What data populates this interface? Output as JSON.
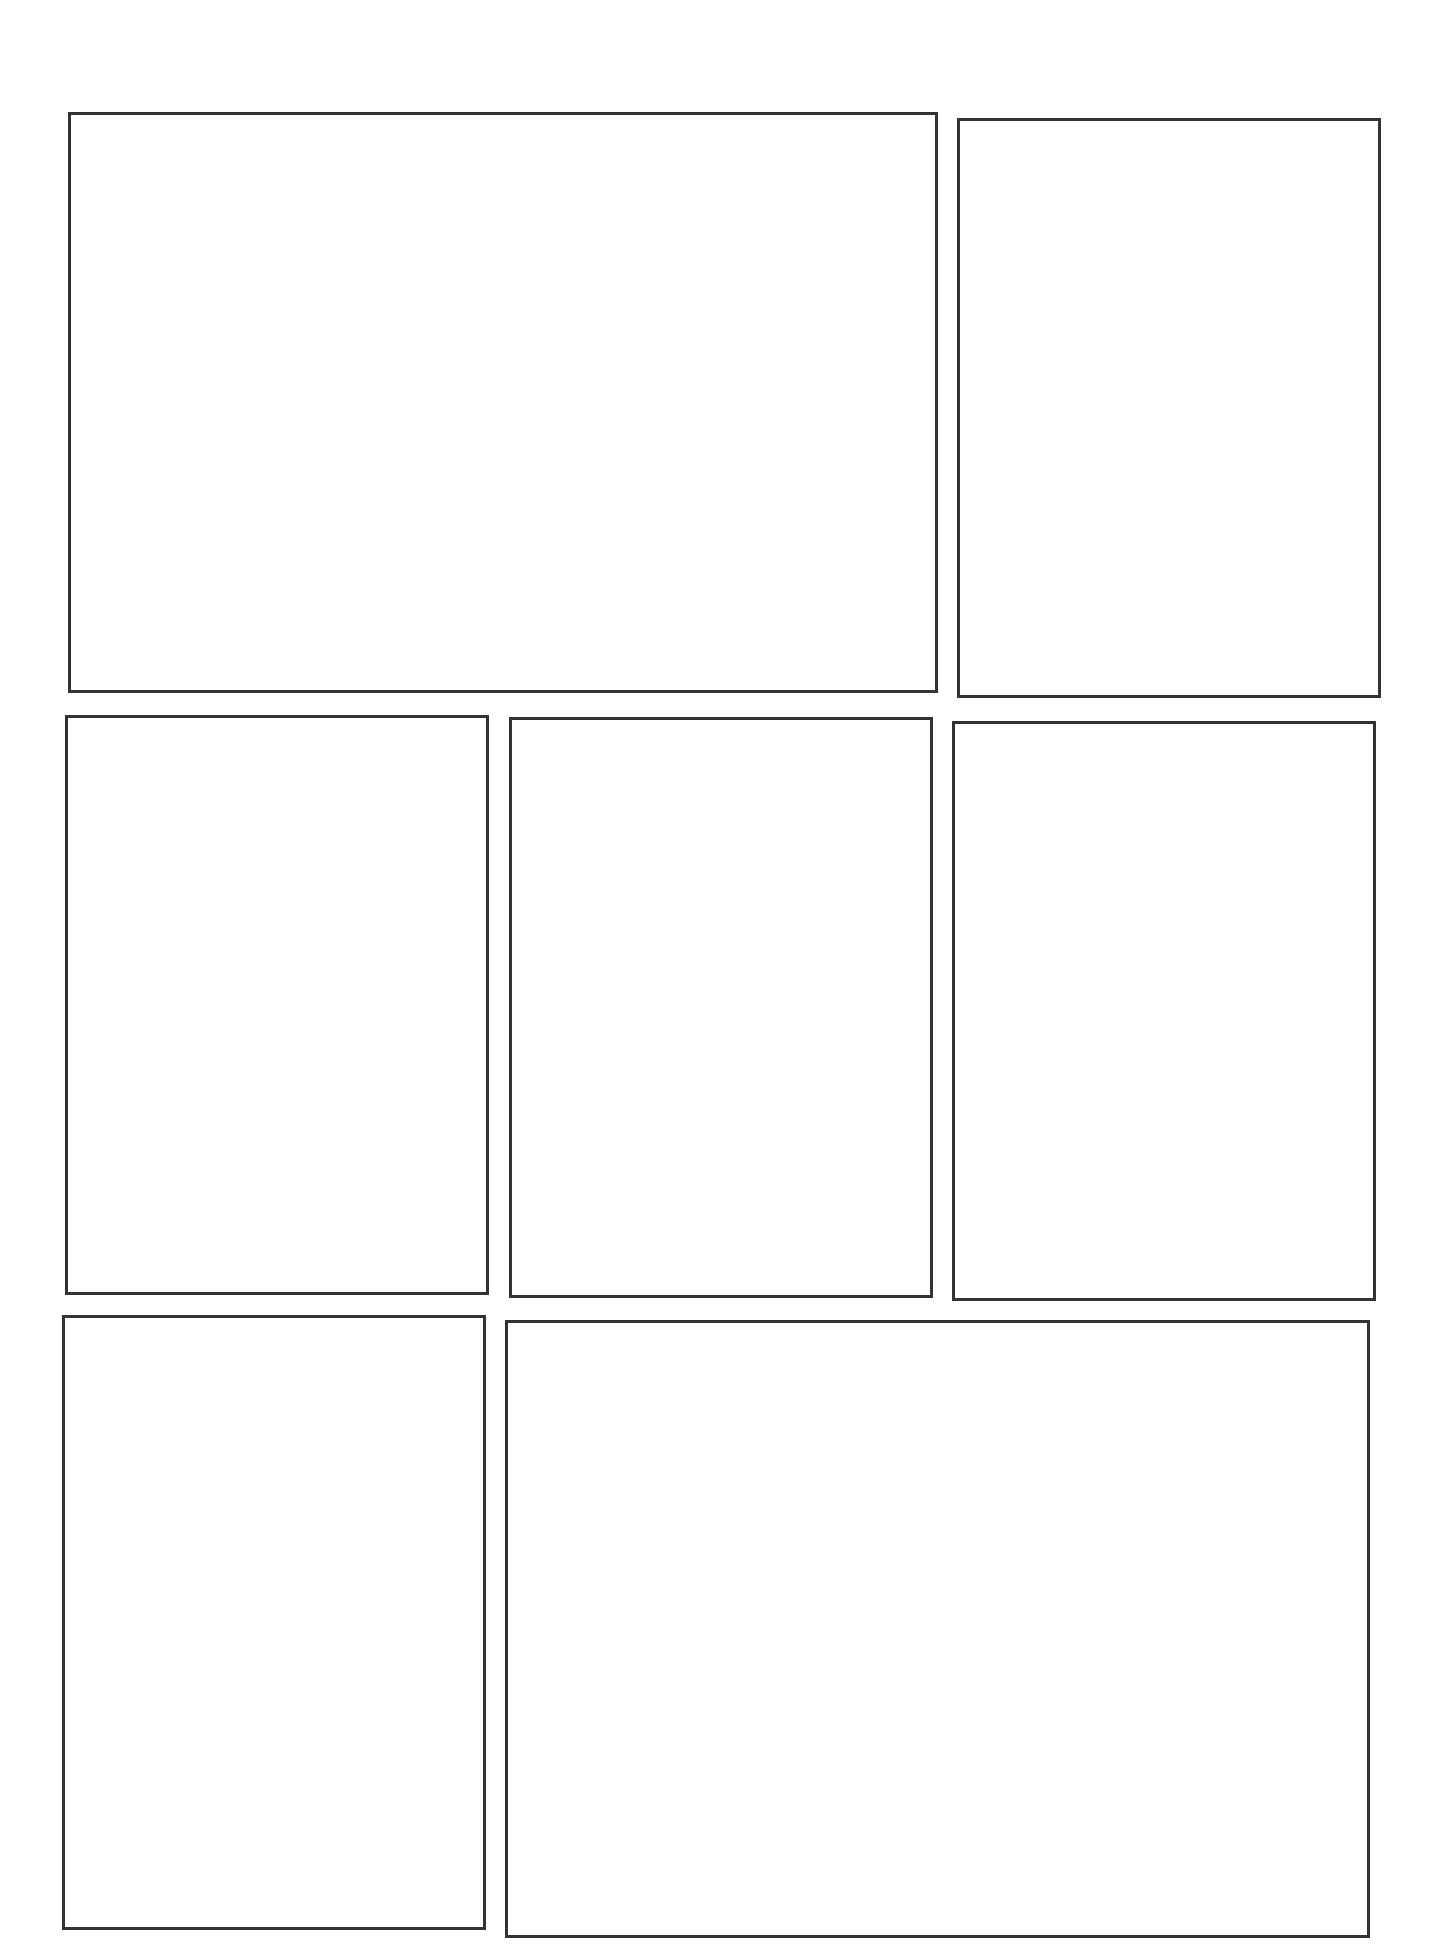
{
  "page": {
    "type": "comic-panel-template",
    "background_color": "#ffffff",
    "border_color": "#333333",
    "border_width": 3
  },
  "panels": [
    {
      "id": "panel-1",
      "row": 1,
      "x": 68,
      "y": 112,
      "w": 870,
      "h": 581
    },
    {
      "id": "panel-2",
      "row": 1,
      "x": 957,
      "y": 118,
      "w": 424,
      "h": 580
    },
    {
      "id": "panel-3",
      "row": 2,
      "x": 65,
      "y": 715,
      "w": 424,
      "h": 580
    },
    {
      "id": "panel-4",
      "row": 2,
      "x": 509,
      "y": 717,
      "w": 424,
      "h": 581
    },
    {
      "id": "panel-5",
      "row": 2,
      "x": 952,
      "y": 721,
      "w": 424,
      "h": 580
    },
    {
      "id": "panel-6",
      "row": 3,
      "x": 62,
      "y": 1315,
      "w": 424,
      "h": 615
    },
    {
      "id": "panel-7",
      "row": 3,
      "x": 505,
      "y": 1320,
      "w": 865,
      "h": 618
    }
  ]
}
